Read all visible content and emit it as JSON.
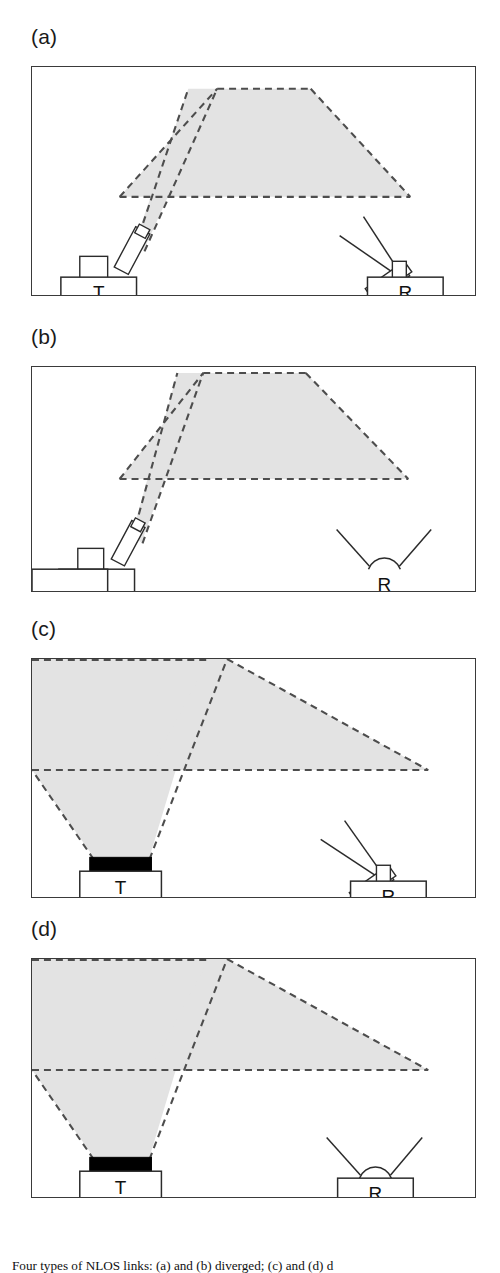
{
  "figure": {
    "caption": "Four types of NLOS links: (a) and (b) diverged; (c) and (d) d",
    "shade_color": "#e3e3e3",
    "dash_color": "#4d4d4d",
    "frame_color": "#3a3a3a",
    "emitter_fill": "#000000",
    "background": "#ffffff"
  },
  "panels": [
    {
      "label": "(a)",
      "transmitter": {
        "node_label": "T",
        "beam": "narrow",
        "emitter_icon": "tilted-collimator-icon"
      },
      "receiver": {
        "node_label": "R",
        "fov": "narrow",
        "detector_icon": "tilted-telescope-icon"
      },
      "description": "narrow transmitter beam, narrow receiver field of view"
    },
    {
      "label": "(b)",
      "transmitter": {
        "node_label": "T",
        "beam": "narrow",
        "emitter_icon": "tilted-collimator-icon"
      },
      "receiver": {
        "node_label": "R",
        "fov": "wide",
        "detector_icon": "hemispherical-dome-icon"
      },
      "description": "narrow transmitter beam, wide receiver field of view"
    },
    {
      "label": "(c)",
      "transmitter": {
        "node_label": "T",
        "beam": "wide",
        "emitter_icon": "flat-diffuse-emitter-icon"
      },
      "receiver": {
        "node_label": "R",
        "fov": "narrow",
        "detector_icon": "tilted-telescope-icon"
      },
      "description": "wide transmitter beam, narrow receiver field of view"
    },
    {
      "label": "(d)",
      "transmitter": {
        "node_label": "T",
        "beam": "wide",
        "emitter_icon": "flat-diffuse-emitter-icon"
      },
      "receiver": {
        "node_label": "R",
        "fov": "wide",
        "detector_icon": "hemispherical-dome-icon"
      },
      "description": "wide transmitter beam, wide receiver field of view"
    }
  ],
  "geometry": {
    "panel_a": {
      "top": 66,
      "height": 230
    },
    "panel_b": {
      "top": 366,
      "height": 226
    },
    "panel_c": {
      "top": 658,
      "height": 240
    },
    "panel_d": {
      "top": 958,
      "height": 240
    }
  }
}
